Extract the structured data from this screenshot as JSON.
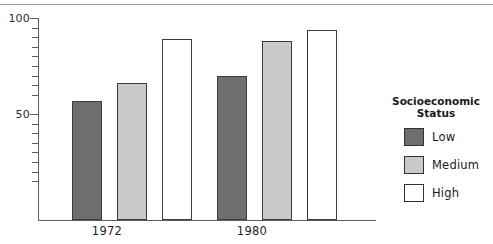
{
  "chart_data": {
    "type": "bar",
    "title": "",
    "subtitle": "",
    "xlabel": "",
    "ylabel": "",
    "categories": [
      "1972",
      "1980"
    ],
    "series": [
      {
        "name": "Low",
        "values": [
          57,
          70
        ],
        "color": "#6e6e6e"
      },
      {
        "name": "Medium",
        "values": [
          66,
          88
        ],
        "color": "#c9c9c9"
      },
      {
        "name": "High",
        "values": [
          89,
          94
        ],
        "color": "#ffffff"
      }
    ],
    "ylim": [
      0,
      100
    ],
    "yticks": [
      100,
      50
    ],
    "ytick_labels": [
      "100",
      "50"
    ],
    "minor_yticks": [
      95,
      90,
      85,
      80,
      75,
      70,
      65,
      60,
      45,
      40,
      35,
      30,
      25,
      20,
      15
    ],
    "grid": false,
    "legend_position": "right",
    "legend": {
      "title_line1": "Socioeconomic",
      "title_line2": "Status",
      "entries": [
        "Low",
        "Medium",
        "High"
      ]
    }
  },
  "colors": {
    "low": "#6e6e6e",
    "medium": "#c9c9c9",
    "high": "#ffffff",
    "outline": "#3b3b3b",
    "axis": "#5d5d5d",
    "text": "#1a1a1a",
    "rule": "#9a9a9a"
  }
}
